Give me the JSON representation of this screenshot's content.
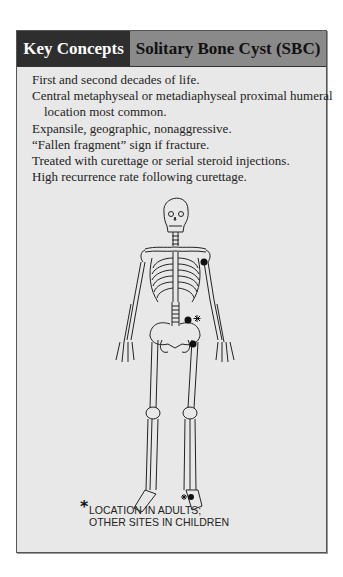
{
  "header": {
    "left_label": "Key Concepts",
    "right_label": "Solitary Bone Cyst (SBC)"
  },
  "concepts": [
    {
      "text": "First and second decades of life.",
      "indent": false
    },
    {
      "text": "Central metaphyseal or metadiaphyseal proximal humeral",
      "indent": false
    },
    {
      "text": "location most common.",
      "indent": true
    },
    {
      "text": "Expansile, geographic, nonaggressive.",
      "indent": false
    },
    {
      "text": "“Fallen fragment” sign if fracture.",
      "indent": false
    },
    {
      "text": "Treated with curettage or serial steroid injections.",
      "indent": false
    },
    {
      "text": "High recurrence rate following curettage.",
      "indent": false
    }
  ],
  "figure": {
    "name": "skeleton-diagram",
    "markers": [
      "proximal-humerus",
      "ilium",
      "femoral-neck",
      "calcaneus"
    ],
    "asterisk_markers": [
      "ilium",
      "calcaneus"
    ]
  },
  "caption": {
    "star": "*",
    "line1": "LOCATION IN ADULTS;",
    "line2": "OTHER SITES IN CHILDREN"
  },
  "colors": {
    "header_left_bg": "#2e2e2e",
    "header_right_bg": "#8a8a8a",
    "panel_bg": "#e8e8e8"
  }
}
